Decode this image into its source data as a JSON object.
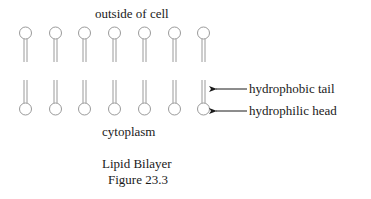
{
  "diagram": {
    "top_label": "outside of cell",
    "bottom_label": "cytoplasm",
    "annotations": {
      "tail": "hydrophobic tail",
      "head": "hydrophilic head"
    },
    "caption": {
      "title": "Lipid Bilayer",
      "figure": "Figure 23.3"
    },
    "lipid_count_per_layer": 7,
    "colors": {
      "lipid_stroke": "#9a9a9a",
      "text": "#1a1a1a",
      "arrow": "#1a1a1a"
    }
  }
}
